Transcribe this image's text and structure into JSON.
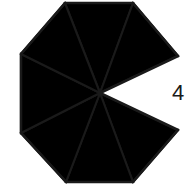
{
  "figure": {
    "name": "octagon-with-missing-sector",
    "fill_color": "#a8a8a8",
    "stroke_color": "#1a1a1a",
    "background_color": "#ffffff",
    "center": {
      "x": 100,
      "y": 93
    },
    "vertices": [
      {
        "id": "v-top-left",
        "x": 65,
        "y": 3
      },
      {
        "id": "v-top-right",
        "x": 133,
        "y": 3
      },
      {
        "id": "v-right-upper",
        "x": 178,
        "y": 56
      },
      {
        "id": "v-right-lower",
        "x": 178,
        "y": 130
      },
      {
        "id": "v-bottom-right",
        "x": 133,
        "y": 182
      },
      {
        "id": "v-bottom-left",
        "x": 66,
        "y": 182
      },
      {
        "id": "v-left-lower",
        "x": 21,
        "y": 133
      },
      {
        "id": "v-left-upper",
        "x": 21,
        "y": 54
      }
    ],
    "sectors": [
      {
        "id": "sector-top",
        "from": "v-top-left",
        "to": "v-top-right",
        "filled": true
      },
      {
        "id": "sector-upper-right",
        "from": "v-top-right",
        "to": "v-right-upper",
        "filled": true
      },
      {
        "id": "sector-right",
        "from": "v-right-upper",
        "to": "v-right-lower",
        "filled": false
      },
      {
        "id": "sector-lower-right",
        "from": "v-right-lower",
        "to": "v-bottom-right",
        "filled": true
      },
      {
        "id": "sector-bottom",
        "from": "v-bottom-right",
        "to": "v-bottom-left",
        "filled": true
      },
      {
        "id": "sector-lower-left",
        "from": "v-bottom-left",
        "to": "v-left-lower",
        "filled": true
      },
      {
        "id": "sector-left",
        "from": "v-left-lower",
        "to": "v-left-upper",
        "filled": true
      },
      {
        "id": "sector-upper-left",
        "from": "v-left-upper",
        "to": "v-top-left",
        "filled": true
      }
    ],
    "sector_count_total": 8,
    "sector_count_filled": 7,
    "sector_count_removed": 1
  },
  "labels": {
    "side_length": "4",
    "side_length_position": {
      "x": 172,
      "y": 82
    }
  }
}
